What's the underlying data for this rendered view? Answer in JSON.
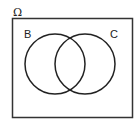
{
  "diagram": {
    "type": "venn",
    "universe_label": "Ω",
    "sets": [
      {
        "label": "B"
      },
      {
        "label": "C"
      }
    ],
    "stroke_color": "#222222"
  }
}
